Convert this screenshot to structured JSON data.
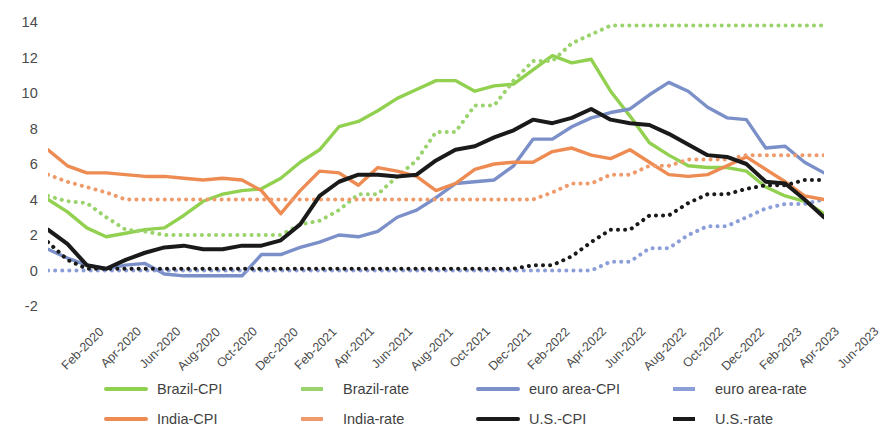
{
  "chart_data": {
    "type": "line",
    "title": "",
    "xlabel": "",
    "ylabel": "",
    "ylim": [
      -2,
      14
    ],
    "yticks": [
      -2,
      0,
      2,
      4,
      6,
      8,
      10,
      12,
      14
    ],
    "grid": false,
    "legend_position": "bottom",
    "x": [
      "Feb-2020",
      "Mar-2020",
      "Apr-2020",
      "May-2020",
      "Jun-2020",
      "Jul-2020",
      "Aug-2020",
      "Sep-2020",
      "Oct-2020",
      "Nov-2020",
      "Dec-2020",
      "Jan-2021",
      "Feb-2021",
      "Mar-2021",
      "Apr-2021",
      "May-2021",
      "Jun-2021",
      "Jul-2021",
      "Aug-2021",
      "Sep-2021",
      "Oct-2021",
      "Nov-2021",
      "Dec-2021",
      "Jan-2022",
      "Feb-2022",
      "Mar-2022",
      "Apr-2022",
      "May-2022",
      "Jun-2022",
      "Jul-2022",
      "Aug-2022",
      "Sep-2022",
      "Oct-2022",
      "Nov-2022",
      "Dec-2022",
      "Jan-2023",
      "Feb-2023",
      "Mar-2023",
      "Apr-2023",
      "May-2023",
      "Jun-2023"
    ],
    "xtick_labels": [
      "Feb-2020",
      "Apr-2020",
      "Jun-2020",
      "Aug-2020",
      "Oct-2020",
      "Dec-2020",
      "Feb-2021",
      "Apr-2021",
      "Jun-2021",
      "Aug-2021",
      "Oct-2021",
      "Dec-2021",
      "Feb-2022",
      "Apr-2022",
      "Jun-2022",
      "Aug-2022",
      "Oct-2022",
      "Dec-2022",
      "Feb-2023",
      "Apr-2023",
      "Jun-2023"
    ],
    "series": [
      {
        "name": "Brazil-CPI",
        "color": "#92d050",
        "style": "solid",
        "values": [
          4.0,
          3.3,
          2.4,
          1.9,
          2.1,
          2.3,
          2.4,
          3.1,
          3.9,
          4.3,
          4.5,
          4.6,
          5.2,
          6.1,
          6.8,
          8.1,
          8.4,
          9.0,
          9.7,
          10.2,
          10.7,
          10.7,
          10.1,
          10.4,
          10.5,
          11.3,
          12.1,
          11.7,
          11.9,
          10.1,
          8.7,
          7.2,
          6.5,
          5.9,
          5.8,
          5.8,
          5.6,
          4.7,
          4.2,
          3.9,
          3.2
        ]
      },
      {
        "name": "Brazil-rate",
        "color": "#9ad36b",
        "style": "dotted",
        "values": [
          4.2,
          3.9,
          3.8,
          3.0,
          2.3,
          2.2,
          2.0,
          2.0,
          2.0,
          2.0,
          2.0,
          2.0,
          2.0,
          2.6,
          2.8,
          3.4,
          4.3,
          4.3,
          5.3,
          6.2,
          7.8,
          7.8,
          9.3,
          9.3,
          10.7,
          11.8,
          11.8,
          12.8,
          13.3,
          13.8,
          13.8,
          13.8,
          13.8,
          13.8,
          13.8,
          13.8,
          13.8,
          13.8,
          13.8,
          13.8,
          13.8
        ]
      },
      {
        "name": "euro area-CPI",
        "color": "#7b8fc9",
        "style": "solid",
        "values": [
          1.2,
          0.7,
          0.3,
          0.1,
          0.3,
          0.4,
          -0.2,
          -0.3,
          -0.3,
          -0.3,
          -0.3,
          0.9,
          0.9,
          1.3,
          1.6,
          2.0,
          1.9,
          2.2,
          3.0,
          3.4,
          4.1,
          4.9,
          5.0,
          5.1,
          5.9,
          7.4,
          7.4,
          8.1,
          8.6,
          8.9,
          9.1,
          9.9,
          10.6,
          10.1,
          9.2,
          8.6,
          8.5,
          6.9,
          7.0,
          6.1,
          5.5
        ]
      },
      {
        "name": "euro area-rate",
        "color": "#8c9ed8",
        "style": "dotted",
        "values": [
          0.0,
          0.0,
          0.0,
          0.0,
          0.0,
          0.0,
          0.0,
          0.0,
          0.0,
          0.0,
          0.0,
          0.0,
          0.0,
          0.0,
          0.0,
          0.0,
          0.0,
          0.0,
          0.0,
          0.0,
          0.0,
          0.0,
          0.0,
          0.0,
          0.0,
          0.0,
          0.0,
          0.0,
          0.0,
          0.5,
          0.5,
          1.25,
          1.25,
          2.0,
          2.5,
          2.5,
          3.0,
          3.5,
          3.75,
          3.75,
          4.0
        ]
      },
      {
        "name": "India-CPI",
        "color": "#ed8b52",
        "style": "solid",
        "values": [
          6.8,
          5.9,
          5.5,
          5.5,
          5.4,
          5.3,
          5.3,
          5.2,
          5.1,
          5.2,
          5.1,
          4.5,
          3.2,
          4.5,
          5.6,
          5.5,
          4.8,
          5.8,
          5.6,
          5.3,
          4.5,
          4.9,
          5.7,
          6.0,
          6.1,
          6.1,
          6.7,
          6.9,
          6.5,
          6.3,
          6.8,
          6.1,
          5.4,
          5.3,
          5.4,
          5.9,
          6.4,
          5.7,
          5.0,
          4.2,
          4.0
        ]
      },
      {
        "name": "India-rate",
        "color": "#ef9a6a",
        "style": "dotted",
        "values": [
          5.4,
          5.0,
          4.7,
          4.4,
          4.0,
          4.0,
          4.0,
          4.0,
          4.0,
          4.0,
          4.0,
          4.0,
          4.0,
          4.0,
          4.0,
          4.0,
          4.0,
          4.0,
          4.0,
          4.0,
          4.0,
          4.0,
          4.0,
          4.0,
          4.0,
          4.0,
          4.4,
          4.9,
          4.9,
          5.4,
          5.4,
          5.9,
          5.9,
          6.25,
          6.25,
          6.25,
          6.5,
          6.5,
          6.5,
          6.5,
          6.5
        ]
      },
      {
        "name": "U.S.-CPI",
        "color": "#1a1a1a",
        "style": "solid",
        "values": [
          2.3,
          1.5,
          0.3,
          0.1,
          0.6,
          1.0,
          1.3,
          1.4,
          1.2,
          1.2,
          1.4,
          1.4,
          1.7,
          2.6,
          4.2,
          5.0,
          5.4,
          5.4,
          5.3,
          5.4,
          6.2,
          6.8,
          7.0,
          7.5,
          7.9,
          8.5,
          8.3,
          8.6,
          9.1,
          8.5,
          8.3,
          8.2,
          7.7,
          7.1,
          6.5,
          6.4,
          6.0,
          5.0,
          4.9,
          4.0,
          3.0
        ]
      },
      {
        "name": "U.S.-rate",
        "color": "#1a1a1a",
        "style": "dotted",
        "values": [
          1.6,
          0.6,
          0.1,
          0.1,
          0.1,
          0.1,
          0.1,
          0.1,
          0.1,
          0.1,
          0.1,
          0.1,
          0.1,
          0.1,
          0.1,
          0.1,
          0.1,
          0.1,
          0.1,
          0.1,
          0.1,
          0.1,
          0.1,
          0.1,
          0.1,
          0.3,
          0.3,
          0.8,
          1.6,
          2.3,
          2.3,
          3.1,
          3.1,
          3.8,
          4.3,
          4.3,
          4.6,
          4.8,
          4.8,
          5.1,
          5.1
        ]
      }
    ]
  },
  "legend": {
    "items": [
      {
        "label": "Brazil-CPI",
        "color": "#92d050",
        "style": "solid"
      },
      {
        "label": "Brazil-rate",
        "color": "#9ad36b",
        "style": "dotted"
      },
      {
        "label": "euro area-CPI",
        "color": "#7b8fc9",
        "style": "solid"
      },
      {
        "label": "euro area-rate",
        "color": "#8c9ed8",
        "style": "dotted"
      },
      {
        "label": "India-CPI",
        "color": "#ed8b52",
        "style": "solid"
      },
      {
        "label": "India-rate",
        "color": "#ef9a6a",
        "style": "dotted"
      },
      {
        "label": "U.S.-CPI",
        "color": "#1a1a1a",
        "style": "solid"
      },
      {
        "label": "U.S.-rate",
        "color": "#1a1a1a",
        "style": "dotted"
      }
    ]
  }
}
